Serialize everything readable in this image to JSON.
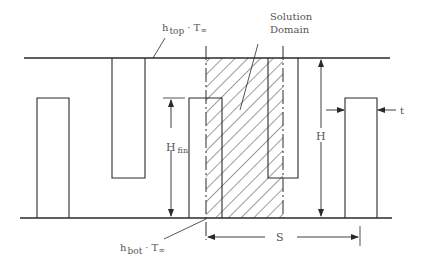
{
  "diagram": {
    "type": "fin-array-cross-section",
    "labels": {
      "h_top": "h",
      "h_top_sub": "top",
      "t_inf_top": "· T",
      "inf_symbol": "∞",
      "h_bot": "h",
      "h_bot_sub": "bot",
      "t_inf_bot": "· T",
      "solution_line1": "Solution",
      "solution_line2": "Domain",
      "H": "H",
      "H_fin": "H",
      "H_fin_sub": "fin",
      "t": "t",
      "S": "S"
    },
    "colors": {
      "line": "#2a2a2a",
      "hatch": "#3a3a3a",
      "text": "#555555",
      "background": "#ffffff"
    }
  }
}
